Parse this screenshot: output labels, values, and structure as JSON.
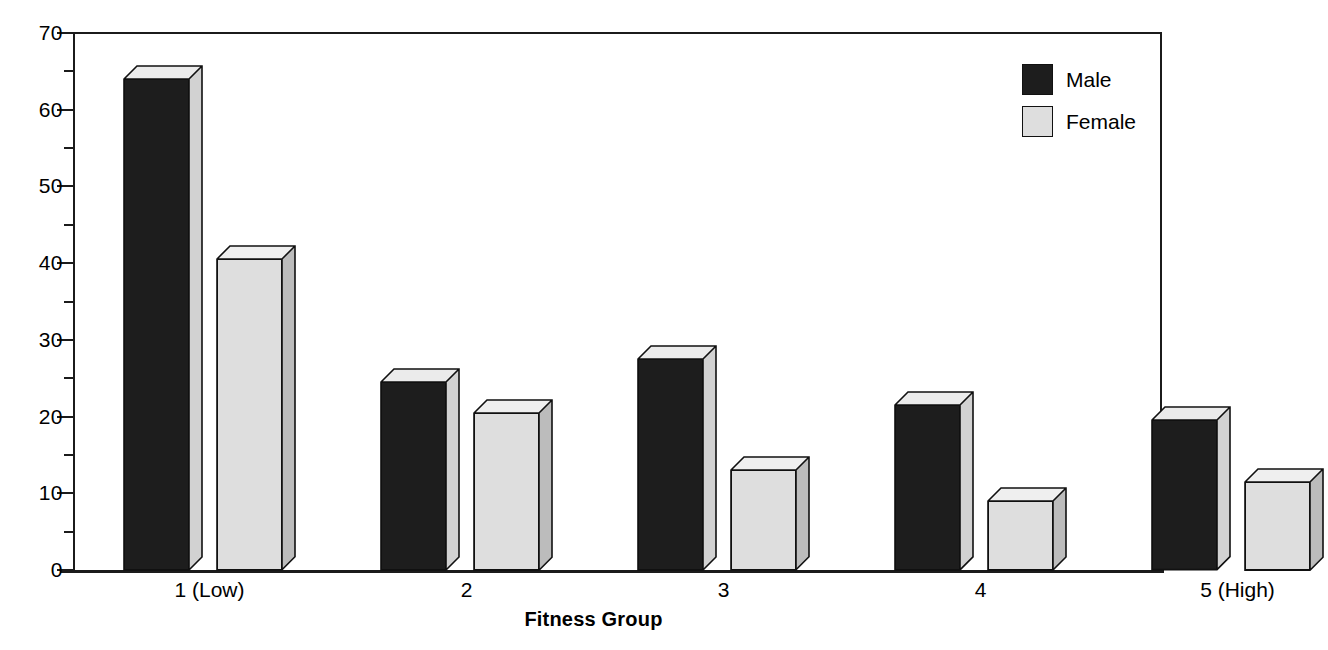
{
  "chart_data": {
    "type": "bar",
    "title": "",
    "xlabel": "Fitness Group",
    "ylabel": "",
    "categories": [
      "1 (Low)",
      "2",
      "3",
      "4",
      "5 (High)"
    ],
    "series": [
      {
        "name": "Male",
        "color": "#1d1d1d",
        "values": [
          64,
          24.5,
          27.5,
          21.5,
          19.5
        ]
      },
      {
        "name": "Female",
        "color": "#dedede",
        "values": [
          40.5,
          20.5,
          13,
          9,
          11.5
        ]
      }
    ],
    "ylim": [
      0,
      70
    ],
    "ytick_labels": [
      "0",
      "10",
      "20",
      "30",
      "40",
      "50",
      "60",
      "70"
    ],
    "ytick_values": [
      0,
      10,
      20,
      30,
      40,
      50,
      60,
      70
    ],
    "yminor_values": [
      5,
      15,
      25,
      35,
      45,
      55,
      65
    ],
    "grid": false,
    "style": "3d-column",
    "legend": {
      "position": "top-right",
      "entries": [
        {
          "label": "Male",
          "color": "#1d1d1d"
        },
        {
          "label": "Female",
          "color": "#dedede"
        }
      ]
    }
  }
}
